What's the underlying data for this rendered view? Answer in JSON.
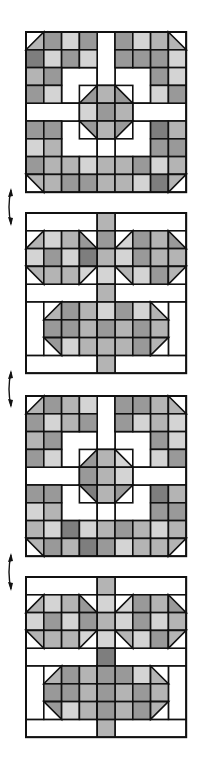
{
  "diagram": {
    "colors": {
      "line": "#111111",
      "white": "#ffffff",
      "L": "#d4d4d4",
      "M": "#b4b4b4",
      "D": "#999999",
      "X": "#7e7e7e"
    },
    "cell_size": 17.8,
    "blocks": [
      {
        "id": "block-a-1",
        "type": "star-cross",
        "x": 26,
        "y": 32,
        "grid": [
          "tM DLDW DLMt",
          "XLDL W DDDL",
          "MD      DL",
          "DL      LD",
          "",
          "DD      XM",
          "LM      DD",
          "DMMLMMDLM",
          "bMDDMMLXb"
        ]
      },
      {
        "id": "block-b-1",
        "type": "flower-rows",
        "x": 26,
        "y": 213
      },
      {
        "id": "block-a-2",
        "type": "star-cross",
        "x": 26,
        "y": 396
      },
      {
        "id": "block-b-2",
        "type": "flower-rows",
        "x": 26,
        "y": 577
      }
    ],
    "arrows": [
      {
        "id": "arrow-1",
        "y": 190,
        "direction": "up-down"
      },
      {
        "id": "arrow-2",
        "y": 372,
        "direction": "up-down"
      },
      {
        "id": "arrow-3",
        "y": 555,
        "direction": "up-down"
      }
    ]
  }
}
